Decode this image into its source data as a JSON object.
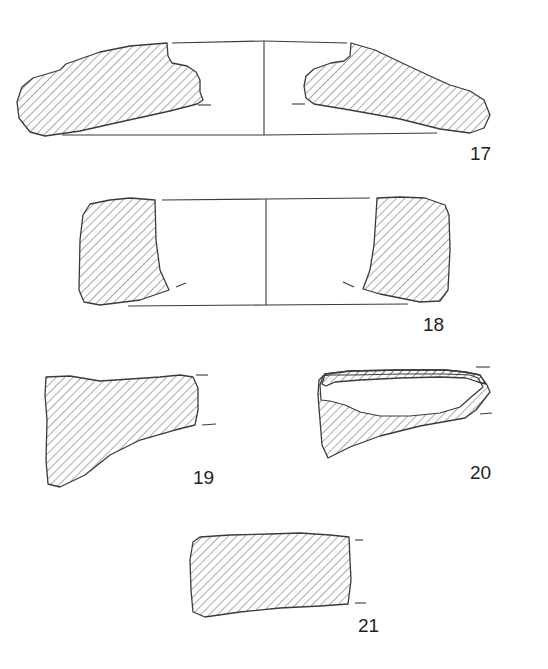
{
  "figure": {
    "type": "archaeological sherd profile drawings (hatched sections)",
    "items": [
      {
        "id": "17",
        "label": "17",
        "kind": "full profile, both sides with center axis"
      },
      {
        "id": "18",
        "label": "18",
        "kind": "full profile, both sides with center axis"
      },
      {
        "id": "19",
        "label": "19",
        "kind": "fragment section"
      },
      {
        "id": "20",
        "label": "20",
        "kind": "fragment section with partial hatching"
      },
      {
        "id": "21",
        "label": "21",
        "kind": "fragment section"
      }
    ]
  },
  "colors": {
    "line": "#3a3a3a",
    "background": "#ffffff",
    "label": "#222222"
  }
}
